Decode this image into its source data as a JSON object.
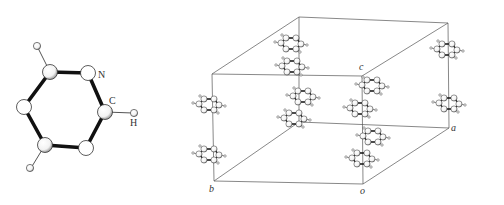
{
  "molecule": {
    "name": "pyridine",
    "labels": {
      "nitrogen": "N",
      "carbon": "C",
      "hydrogen": "H"
    }
  },
  "unit_cell": {
    "axis_labels": {
      "a": "a",
      "b": "b",
      "c": "c",
      "origin": "o"
    }
  },
  "colors": {
    "bond": "#111111",
    "line": "#555555",
    "atom_fill": "#ffffff",
    "atom_shade": "#9a9a9a"
  }
}
